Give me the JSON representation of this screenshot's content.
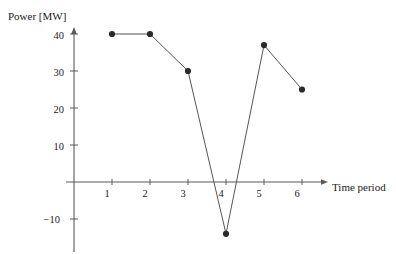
{
  "chart_data": {
    "type": "line",
    "title": "",
    "subtitle": "",
    "xlabel": "Time period",
    "ylabel": "Power [MW]",
    "x": [
      1,
      2,
      3,
      4,
      5,
      6
    ],
    "categories": [
      "1",
      "2",
      "3",
      "4",
      "5",
      "6"
    ],
    "values": [
      40,
      40,
      30,
      -14,
      37,
      25
    ],
    "series": [
      {
        "name": "Power",
        "values": [
          40,
          40,
          30,
          -14,
          37,
          25
        ]
      }
    ],
    "xlim": [
      0,
      7.4
    ],
    "ylim": [
      -18,
      44
    ],
    "x_ticks": [
      1,
      2,
      3,
      4,
      5,
      6
    ],
    "x_tick_labels": [
      "1",
      "2",
      "3",
      "4",
      "5",
      "6"
    ],
    "y_ticks": [
      -10,
      10,
      20,
      30,
      40
    ],
    "y_tick_labels": [
      "−10",
      "10",
      "20",
      "30",
      "40"
    ],
    "grid": false,
    "legend": "none",
    "marker": "filled-circle",
    "line_color": "#555555",
    "marker_color": "#2b2b2b",
    "axis_color": "#5a5a5a",
    "axis_style": "arrow-tipped-cartesian"
  },
  "axes": {
    "y_title": "Power [MW]",
    "x_title": "Time period"
  }
}
